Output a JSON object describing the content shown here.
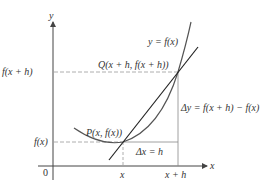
{
  "diagram": {
    "type": "secant-line-derivative",
    "axes": {
      "x_label": "x",
      "y_label": "y",
      "origin_label": "0"
    },
    "x_ticks": [
      {
        "label": "x",
        "px": 123
      },
      {
        "label": "x + h",
        "px": 178
      }
    ],
    "y_ticks": [
      {
        "label": "f(x + h)",
        "py": 72
      },
      {
        "label": "f(x)",
        "py": 142
      }
    ],
    "curve_label": "y = f(x)",
    "points": {
      "P": {
        "label": "P(x, f(x))"
      },
      "Q": {
        "label": "Q(x + h, f(x + h))"
      }
    },
    "increments": {
      "dx": "Δx = h",
      "dy": "Δy = f(x + h) − f(x)"
    },
    "colors": {
      "axis": "#444444",
      "curve": "#555555",
      "secant": "#222222",
      "dashed": "#999999",
      "text": "#333333"
    }
  }
}
